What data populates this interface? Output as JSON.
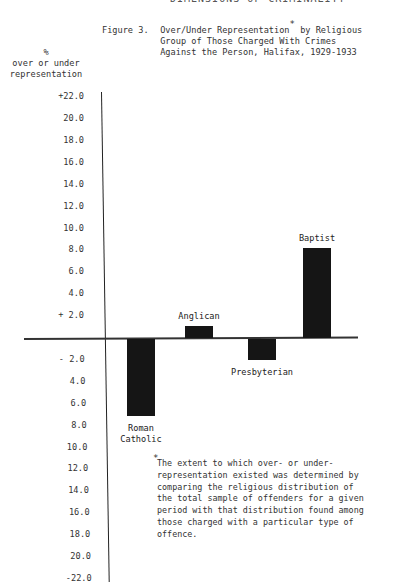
{
  "running_header": "DIMENSIONS OF CRIMINALITY",
  "figure": {
    "label": "Figure 3.",
    "title_lines": [
      "Over/Under Representation",
      "Group of Those Charged With Crimes",
      "Against the Person, Halifax, 1929-1933"
    ],
    "title_line1_suffix": " by Religious",
    "asterisk": "*"
  },
  "y_axis": {
    "symbol": "%",
    "label_lines": [
      "over or under",
      "representation"
    ]
  },
  "footnote": {
    "asterisk": "*",
    "text": "The extent to which over- or under-\nrepresentation existed was determined by\ncomparing the religious distribution of\nthe total sample of offenders for a given\nperiod with that distribution found among\nthose charged with a particular type of\noffence."
  },
  "chart_data": {
    "type": "bar",
    "title": "Figure 3. Over/Under Representation* by Religious Group of Those Charged With Crimes Against the Person, Halifax, 1929-1933",
    "xlabel": "",
    "ylabel": "% over or under representation",
    "categories": [
      "Roman Catholic",
      "Anglican",
      "Presbyterian",
      "Baptist"
    ],
    "values": [
      -7.0,
      1.1,
      -1.9,
      8.2
    ],
    "ylim": [
      -22.0,
      22.0
    ],
    "y_ticks": [
      "+22.0",
      "20.0",
      "18.0",
      "16.0",
      "14.0",
      "12.0",
      "10.0",
      "8.0",
      "6.0",
      "4.0",
      "+ 2.0",
      "- 2.0",
      "4.0",
      "6.0",
      "8.0",
      "10.0",
      "12.0",
      "14.0",
      "16.0",
      "18.0",
      "20.0",
      "-22.0"
    ],
    "grid": false,
    "legend": null,
    "bar_color": "#151515",
    "annotation": "*The extent to which over- or under-representation existed was determined by comparing the religious distribution of the total sample of offenders for a given period with that distribution found among those charged with a particular type of offence."
  }
}
